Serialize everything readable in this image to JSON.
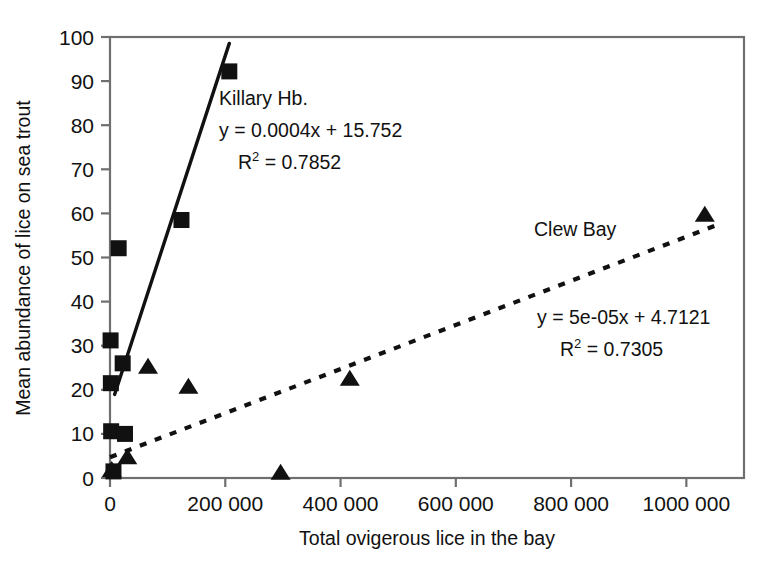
{
  "chart_data": {
    "type": "scatter",
    "title": "",
    "xlabel": "Total ovigerous lice in the bay",
    "ylabel": "Mean abundance of lice on sea trout",
    "xlim": [
      0,
      1100000
    ],
    "ylim": [
      0,
      100
    ],
    "grid": false,
    "legend_position": "inline-annotation",
    "xticks": [
      0,
      200000,
      400000,
      600000,
      800000,
      1000000
    ],
    "xtick_labels": [
      "0",
      "200 000",
      "400 000",
      "600 000",
      "800 000",
      "1000 000"
    ],
    "yticks": [
      0,
      10,
      20,
      30,
      40,
      50,
      60,
      70,
      80,
      90,
      100
    ],
    "ytick_labels": [
      "0",
      "10",
      "20",
      "30",
      "40",
      "50",
      "60",
      "70",
      "80",
      "90",
      "100"
    ],
    "series": [
      {
        "name": "Killary Hb.",
        "marker": "square",
        "trendline_style": "solid",
        "equation": "y = 0.0004x + 15.752",
        "r_squared_label": "R",
        "r_squared_exponent": "2",
        "r_squared_value": "= 0.7852",
        "slope": 0.0004,
        "intercept": 15.752,
        "r2": 0.7852,
        "points": [
          {
            "x": 1000,
            "y": 31.2
          },
          {
            "x": 1500,
            "y": 21.5
          },
          {
            "x": 2000,
            "y": 10.6
          },
          {
            "x": 6000,
            "y": 1.5
          },
          {
            "x": 15000,
            "y": 52.1
          },
          {
            "x": 22000,
            "y": 26.0
          },
          {
            "x": 26000,
            "y": 10.0
          },
          {
            "x": 124000,
            "y": 58.5
          },
          {
            "x": 207000,
            "y": 92.2
          }
        ],
        "trend_x": [
          8000,
          207000
        ]
      },
      {
        "name": "Clew Bay",
        "marker": "triangle",
        "trendline_style": "dashed",
        "equation": "y = 5e-05x + 4.7121",
        "r_squared_label": "R",
        "r_squared_exponent": "2",
        "r_squared_value": "= 0.7305",
        "slope": 5e-05,
        "intercept": 4.7121,
        "r2": 0.7305,
        "points": [
          {
            "x": 3000,
            "y": 1.6
          },
          {
            "x": 30000,
            "y": 4.5
          },
          {
            "x": 66000,
            "y": 25.0
          },
          {
            "x": 136000,
            "y": 20.5
          },
          {
            "x": 296000,
            "y": 1.0
          },
          {
            "x": 416000,
            "y": 22.3
          },
          {
            "x": 1032000,
            "y": 59.5
          }
        ],
        "trend_x": [
          0,
          1060000
        ]
      }
    ]
  },
  "annotations": {
    "killary": {
      "name": "Killary Hb.",
      "equation": "y = 0.0004x + 15.752",
      "r_prefix": "R",
      "r_sup": "2",
      "r_rest": " = 0.7852"
    },
    "clew": {
      "name": "Clew Bay",
      "equation": "y = 5e-05x + 4.7121",
      "r_prefix": "R",
      "r_sup": "2",
      "r_rest": " = 0.7305"
    }
  },
  "colors": {
    "ink": "#111111",
    "frame": "#6f6f6f",
    "background": "#ffffff"
  }
}
